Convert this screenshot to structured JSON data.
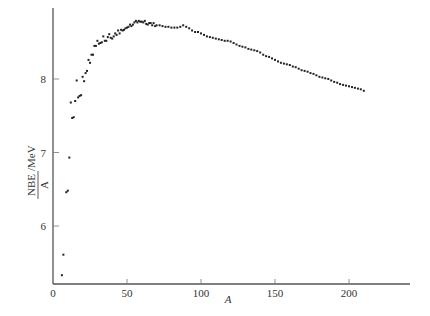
{
  "chart_data": {
    "type": "scatter",
    "title": "",
    "xlabel": "A",
    "ylabel_numerator": "NBE",
    "ylabel_denominator": "A",
    "ylabel_unit": "/MeV",
    "ylabel": "NBE/A /MeV",
    "xlim": [
      0,
      240
    ],
    "ylim": [
      5.2,
      8.95
    ],
    "x_ticks": [
      0,
      50,
      100,
      150,
      200
    ],
    "x_tick_labels": [
      "0",
      "50",
      "100",
      "150",
      "200"
    ],
    "y_ticks": [
      6,
      7,
      8
    ],
    "y_tick_labels": [
      "6",
      "7",
      "8"
    ],
    "grid": false,
    "legend": null,
    "point_color": "#222222",
    "series": [
      {
        "name": "binding energy per nucleon",
        "points": [
          [
            6,
            5.33
          ],
          [
            7,
            5.61
          ],
          [
            9,
            6.46
          ],
          [
            10,
            6.48
          ],
          [
            11,
            6.93
          ],
          [
            12,
            7.68
          ],
          [
            13,
            7.47
          ],
          [
            14,
            7.48
          ],
          [
            15,
            7.7
          ],
          [
            16,
            7.98
          ],
          [
            17,
            7.75
          ],
          [
            18,
            7.77
          ],
          [
            19,
            7.78
          ],
          [
            20,
            8.03
          ],
          [
            21,
            7.97
          ],
          [
            22,
            8.08
          ],
          [
            23,
            8.11
          ],
          [
            24,
            8.26
          ],
          [
            25,
            8.22
          ],
          [
            26,
            8.33
          ],
          [
            27,
            8.33
          ],
          [
            28,
            8.45
          ],
          [
            29,
            8.45
          ],
          [
            30,
            8.52
          ],
          [
            31,
            8.48
          ],
          [
            32,
            8.49
          ],
          [
            33,
            8.5
          ],
          [
            34,
            8.58
          ],
          [
            35,
            8.52
          ],
          [
            36,
            8.52
          ],
          [
            37,
            8.57
          ],
          [
            38,
            8.61
          ],
          [
            39,
            8.56
          ],
          [
            40,
            8.55
          ],
          [
            41,
            8.58
          ],
          [
            42,
            8.62
          ],
          [
            43,
            8.6
          ],
          [
            44,
            8.66
          ],
          [
            45,
            8.62
          ],
          [
            46,
            8.67
          ],
          [
            47,
            8.66
          ],
          [
            48,
            8.67
          ],
          [
            49,
            8.69
          ],
          [
            50,
            8.7
          ],
          [
            51,
            8.71
          ],
          [
            52,
            8.74
          ],
          [
            53,
            8.72
          ],
          [
            54,
            8.74
          ],
          [
            55,
            8.77
          ],
          [
            56,
            8.79
          ],
          [
            57,
            8.77
          ],
          [
            58,
            8.79
          ],
          [
            59,
            8.78
          ],
          [
            60,
            8.78
          ],
          [
            61,
            8.77
          ],
          [
            62,
            8.79
          ],
          [
            63,
            8.75
          ],
          [
            64,
            8.74
          ],
          [
            65,
            8.76
          ],
          [
            66,
            8.76
          ],
          [
            67,
            8.73
          ],
          [
            68,
            8.76
          ],
          [
            69,
            8.72
          ],
          [
            70,
            8.73
          ],
          [
            72,
            8.73
          ],
          [
            74,
            8.72
          ],
          [
            76,
            8.71
          ],
          [
            78,
            8.71
          ],
          [
            80,
            8.7
          ],
          [
            82,
            8.7
          ],
          [
            84,
            8.7
          ],
          [
            86,
            8.71
          ],
          [
            88,
            8.73
          ],
          [
            90,
            8.71
          ],
          [
            92,
            8.69
          ],
          [
            94,
            8.66
          ],
          [
            96,
            8.64
          ],
          [
            98,
            8.64
          ],
          [
            100,
            8.62
          ],
          [
            102,
            8.6
          ],
          [
            104,
            8.58
          ],
          [
            106,
            8.57
          ],
          [
            108,
            8.56
          ],
          [
            110,
            8.55
          ],
          [
            112,
            8.54
          ],
          [
            114,
            8.53
          ],
          [
            116,
            8.52
          ],
          [
            118,
            8.52
          ],
          [
            120,
            8.51
          ],
          [
            122,
            8.49
          ],
          [
            124,
            8.47
          ],
          [
            126,
            8.45
          ],
          [
            128,
            8.44
          ],
          [
            130,
            8.43
          ],
          [
            132,
            8.41
          ],
          [
            134,
            8.4
          ],
          [
            136,
            8.39
          ],
          [
            138,
            8.38
          ],
          [
            140,
            8.36
          ],
          [
            142,
            8.33
          ],
          [
            144,
            8.31
          ],
          [
            146,
            8.3
          ],
          [
            148,
            8.28
          ],
          [
            150,
            8.26
          ],
          [
            152,
            8.24
          ],
          [
            154,
            8.22
          ],
          [
            156,
            8.21
          ],
          [
            158,
            8.2
          ],
          [
            160,
            8.19
          ],
          [
            162,
            8.17
          ],
          [
            164,
            8.16
          ],
          [
            166,
            8.14
          ],
          [
            168,
            8.12
          ],
          [
            170,
            8.11
          ],
          [
            172,
            8.1
          ],
          [
            174,
            8.08
          ],
          [
            176,
            8.07
          ],
          [
            178,
            8.05
          ],
          [
            180,
            8.03
          ],
          [
            182,
            8.02
          ],
          [
            184,
            8.01
          ],
          [
            186,
            8.0
          ],
          [
            188,
            7.98
          ],
          [
            190,
            7.96
          ],
          [
            192,
            7.95
          ],
          [
            194,
            7.93
          ],
          [
            196,
            7.92
          ],
          [
            198,
            7.91
          ],
          [
            200,
            7.9
          ],
          [
            202,
            7.89
          ],
          [
            204,
            7.88
          ],
          [
            206,
            7.87
          ],
          [
            208,
            7.86
          ],
          [
            210,
            7.84
          ]
        ]
      }
    ]
  }
}
